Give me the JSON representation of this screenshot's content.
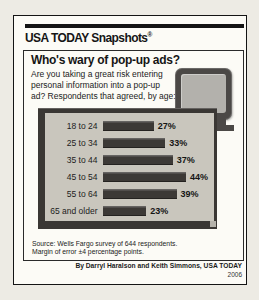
{
  "masthead": {
    "brand": "USA TODAY Snapshots",
    "registered": "®"
  },
  "headline": "Who's wary of pop-up ads?",
  "subtitle_lines": [
    "Are you taking a great risk entering",
    "personal information into a pop-up",
    "ad? Respondents that agreed, by age:"
  ],
  "chart_data": {
    "type": "bar",
    "orientation": "horizontal",
    "title": "Who's wary of pop-up ads?",
    "subtitle": "Are you taking a great risk entering personal information into a pop-up ad? Respondents that agreed, by age:",
    "categories": [
      "18 to 24",
      "25 to 34",
      "35 to 44",
      "45 to 54",
      "55 to 64",
      "65 and older"
    ],
    "values": [
      27,
      33,
      37,
      44,
      39,
      23
    ],
    "value_suffix": "%",
    "xlabel": "",
    "ylabel": "",
    "xlim": [
      0,
      50
    ],
    "grid": false,
    "legend": "none",
    "data_labels": "end-of-bar"
  },
  "footnote_lines": [
    "Source: Wells Fargo survey of 644 respondents.",
    "Margin of error ±4 percentage points."
  ],
  "credit": {
    "byline": "By Darryl Haralson and Keith Simmons, USA TODAY",
    "year": "2006"
  },
  "colors": {
    "bar": "#3c3936",
    "panel_frame": "#3a3734",
    "panel_bg": "#c9c6bd",
    "monitor_frame": "#4b4846",
    "monitor_screen": "#b3b1ac"
  }
}
